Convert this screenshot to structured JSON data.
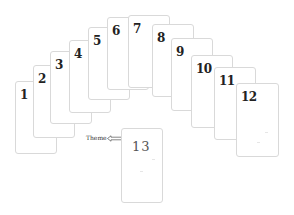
{
  "diagram": {
    "cards": [
      {
        "label": "1",
        "x": 15,
        "y": 81
      },
      {
        "label": "2",
        "x": 33,
        "y": 65
      },
      {
        "label": "3",
        "x": 50,
        "y": 51
      },
      {
        "label": "4",
        "x": 69,
        "y": 40
      },
      {
        "label": "5",
        "x": 88,
        "y": 27
      },
      {
        "label": "6",
        "x": 107,
        "y": 17
      },
      {
        "label": "7",
        "x": 128,
        "y": 15
      },
      {
        "label": "8",
        "x": 152,
        "y": 24
      },
      {
        "label": "9",
        "x": 171,
        "y": 38
      },
      {
        "label": "10",
        "x": 191,
        "y": 55
      },
      {
        "label": "11",
        "x": 214,
        "y": 67
      },
      {
        "label": "12",
        "x": 236,
        "y": 83
      }
    ],
    "focus_card": {
      "label": "13",
      "x": 121,
      "y": 128
    },
    "annotation": {
      "text": "Theme",
      "arrow": "hollow-left-arrow"
    },
    "colors": {
      "card_border": "#d9d9d9",
      "text": "#222222",
      "background": "#ffffff"
    }
  }
}
